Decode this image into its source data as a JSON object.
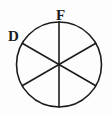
{
  "figure": {
    "background_color": "#fdfdfd",
    "stroke_color": "#1c1c1c",
    "label_color": "#1c1c1c",
    "circle": {
      "center_x": 59,
      "center_y": 64.5,
      "radius": 42.5,
      "stroke_width": 1.6,
      "fill": "none"
    },
    "diameters": [
      {
        "name": "vertical-diameter",
        "angle_degrees": 90,
        "x1": 59,
        "y1": 22,
        "x2": 59,
        "y2": 107,
        "stroke_width": 1.6
      },
      {
        "name": "diagonal-diameter-upper-left-to-lower-right",
        "angle_degrees": 30,
        "x1": 22.2,
        "y1": 43.3,
        "x2": 95.8,
        "y2": 85.7,
        "stroke_width": 1.6
      },
      {
        "name": "diagonal-diameter-lower-left-to-upper-right",
        "angle_degrees": 150,
        "x1": 22.2,
        "y1": 85.7,
        "x2": 95.8,
        "y2": 43.3,
        "stroke_width": 1.6
      }
    ],
    "sector_count": 6,
    "sector_angle_degrees": 60,
    "labels": [
      {
        "id": "label-D",
        "text": "D",
        "position": "upper-left-outside",
        "x": 8,
        "y": 29
      },
      {
        "id": "label-F",
        "text": "F",
        "position": "top-center-above-circle",
        "x": 56,
        "y": 8
      }
    ]
  }
}
